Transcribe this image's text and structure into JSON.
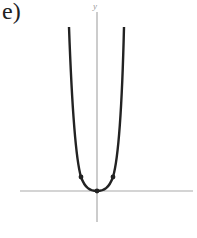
{
  "figure": {
    "label": "e)",
    "y_axis_label": "y",
    "x_axis_label": "x",
    "curve_description": "upward-opening parabola with vertex at origin",
    "colors": {
      "curve": "#222222",
      "axes": "#aaaaaa",
      "background": "#ffffff"
    }
  },
  "graph": {
    "function": "y = x^2 (scaled)",
    "vertex": [
      0,
      0
    ],
    "marked_points": [
      {
        "x": -1,
        "y": 1
      },
      {
        "x": 0,
        "y": 0
      },
      {
        "x": 1,
        "y": 1
      }
    ]
  }
}
